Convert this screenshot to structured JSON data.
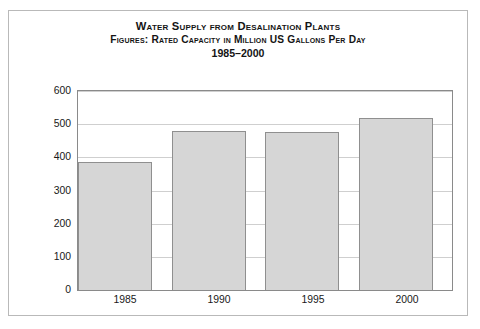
{
  "chart_data": {
    "type": "bar",
    "title": "Water Supply from Desalination Plants",
    "subtitle": "Figures: Rated Capacity in Million US Gallons Per Day",
    "period": "1985–2000",
    "categories": [
      "1985",
      "1990",
      "1995",
      "2000"
    ],
    "values": [
      385,
      480,
      477,
      520
    ],
    "series": [
      {
        "name": "Rated Capacity",
        "values": [
          385,
          480,
          477,
          520
        ]
      }
    ],
    "xlabel": "",
    "ylabel": "",
    "ylim": [
      0,
      600
    ],
    "ytick_labels": [
      "600",
      "500",
      "400",
      "300",
      "200",
      "100",
      "0"
    ],
    "ytick_values": [
      600,
      500,
      400,
      300,
      200,
      100,
      0
    ],
    "grid": true,
    "legend": "none",
    "bar_color": "#d6d6d6",
    "bar_edge_color": "#8f8f8f",
    "grid_color": "#cfcfcf",
    "frame_color": "#8a8a8a",
    "border_color": "#b9b9b9",
    "text_color": "#141414"
  }
}
